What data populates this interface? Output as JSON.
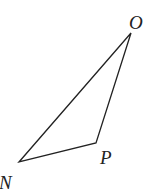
{
  "diagram": {
    "type": "triangle",
    "stroke_color": "#222222",
    "vertices": [
      {
        "label": "O",
        "x": 131,
        "y": 33,
        "label_x": 129,
        "label_y": 29
      },
      {
        "label": "P",
        "x": 96,
        "y": 143,
        "label_x": 100,
        "label_y": 164
      },
      {
        "label": "N",
        "x": 19,
        "y": 162,
        "label_x": -1,
        "label_y": 189
      }
    ]
  }
}
